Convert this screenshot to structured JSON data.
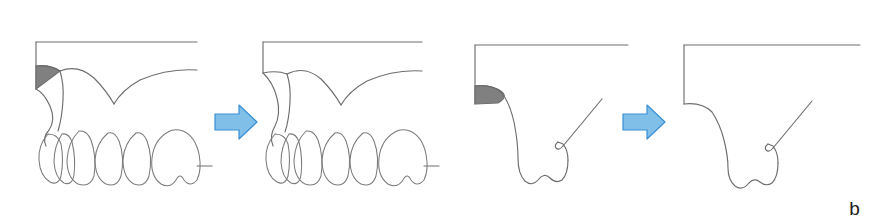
{
  "figure": {
    "label": "b",
    "caption_letter": "b",
    "background_color": "#ffffff",
    "width": 874,
    "height": 224
  },
  "style": {
    "line_color": "#6e6e6e",
    "line_color_soft": "#7b7b7b",
    "defect_fill_color": "#808080",
    "arrow_fill_color": "#7fbfe8",
    "arrow_stroke_color": "#3b8fd4",
    "label_color": "#1c1c1c"
  },
  "panels": [
    {
      "id": "panel-1",
      "name": "frontal-view-before",
      "view": "frontal",
      "state": "before",
      "has_defect_shading": true,
      "defect_shape": "triangle",
      "tooth_count": 6,
      "x": 20,
      "width": 190
    },
    {
      "id": "panel-2",
      "name": "frontal-view-after",
      "view": "frontal",
      "state": "after",
      "has_defect_shading": false,
      "defect_shape": "none",
      "tooth_count": 6,
      "x": 255,
      "width": 190
    },
    {
      "id": "panel-3",
      "name": "cross-section-view-before",
      "view": "cross-section",
      "state": "before",
      "has_defect_shading": true,
      "defect_shape": "curved-wedge",
      "tooth_count": 1,
      "x": 450,
      "width": 190
    },
    {
      "id": "panel-4",
      "name": "cross-section-view-after",
      "view": "cross-section",
      "state": "after",
      "has_defect_shading": false,
      "defect_shape": "none",
      "tooth_count": 1,
      "x": 670,
      "width": 200
    }
  ],
  "arrows": [
    {
      "id": "arrow-1",
      "name": "transition-arrow-frontal",
      "direction": "right",
      "x": 212,
      "y": 102,
      "width": 46,
      "height": 38
    },
    {
      "id": "arrow-2",
      "name": "transition-arrow-cross-section",
      "direction": "right",
      "x": 620,
      "y": 102,
      "width": 46,
      "height": 38
    }
  ]
}
